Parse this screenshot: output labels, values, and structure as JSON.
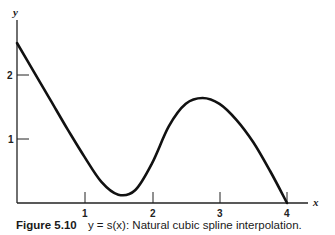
{
  "chart_data": {
    "type": "line",
    "title": "",
    "caption_label": "Figure 5.10",
    "caption_text": "y = s(x): Natural cubic spline interpolation.",
    "xlabel": "x",
    "ylabel": "y",
    "xlim": [
      0,
      4.3
    ],
    "ylim": [
      0,
      2.8
    ],
    "x_ticks": [
      1,
      2,
      3,
      4
    ],
    "y_ticks": [
      1,
      2
    ],
    "x_tick_labels": [
      "1",
      "2",
      "3",
      "4"
    ],
    "y_tick_labels": [
      "1",
      "2"
    ],
    "grid": false,
    "legend": null,
    "series": [
      {
        "name": "s(x)",
        "x": [
          0,
          0.25,
          0.5,
          0.75,
          1.0,
          1.25,
          1.5,
          1.75,
          2.0,
          2.25,
          2.5,
          2.75,
          3.0,
          3.25,
          3.5,
          3.75,
          4.0
        ],
        "y": [
          2.5,
          2.05,
          1.6,
          1.15,
          0.72,
          0.33,
          0.13,
          0.2,
          0.62,
          1.2,
          1.55,
          1.64,
          1.55,
          1.3,
          0.95,
          0.5,
          0.0
        ]
      }
    ]
  },
  "labels": {
    "x_axis": "x",
    "y_axis": "y",
    "x1": "1",
    "x2": "2",
    "x3": "3",
    "x4": "4",
    "y1": "1",
    "y2": "2"
  },
  "caption": {
    "label": "Figure 5.10",
    "text": "y = s(x): Natural cubic spline interpolation."
  }
}
